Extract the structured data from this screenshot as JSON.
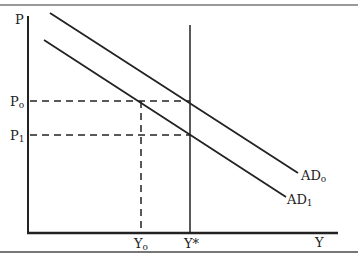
{
  "diagram": {
    "type": "AD-AS shift diagram",
    "axes": {
      "y_label": "P",
      "x_label": "Y"
    },
    "curves": [
      {
        "name": "AD0",
        "label_main": "AD",
        "label_sub": "o"
      },
      {
        "name": "AD1",
        "label_main": "AD",
        "label_sub": "1"
      }
    ],
    "vertical_line": {
      "label": "Y*"
    },
    "price_levels": [
      {
        "label_main": "P",
        "label_sub": "o"
      },
      {
        "label_main": "P",
        "label_sub": "1"
      }
    ],
    "output_levels": [
      {
        "label_main": "Y",
        "label_sub": "o"
      }
    ],
    "colors": {
      "line": "#222222",
      "border": "#555555"
    }
  }
}
